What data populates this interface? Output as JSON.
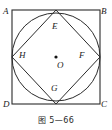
{
  "figure": {
    "caption": "图 5—66",
    "stroke_color": "#2b2b2b",
    "fill_color": "none",
    "center_dot_color": "#141414",
    "background_color": "#ffffff"
  },
  "geometry": {
    "outer_square": {
      "name": "square ABCD",
      "left": 12,
      "top": 10,
      "right": 100,
      "bottom": 104,
      "width": 88,
      "height": 94
    },
    "inscribed_circle": {
      "name": "circle O",
      "cx": 56,
      "cy": 57,
      "r": 44
    },
    "inner_square": {
      "name": "square EFGH",
      "points": "56,10 100,57 56,104 12,57"
    },
    "center_point": {
      "label": "O",
      "cx": 56,
      "cy": 57,
      "dot_radius": 1.6
    }
  },
  "labels": {
    "A": {
      "text": "A",
      "x": 3,
      "y": 7
    },
    "B": {
      "text": "B",
      "x": 101,
      "y": 7
    },
    "C": {
      "text": "C",
      "x": 101,
      "y": 100
    },
    "D": {
      "text": "D",
      "x": 3,
      "y": 100
    },
    "E": {
      "text": "E",
      "x": 52,
      "y": 22
    },
    "F": {
      "text": "F",
      "x": 79,
      "y": 51
    },
    "G": {
      "text": "G",
      "x": 51,
      "y": 84
    },
    "H": {
      "text": "H",
      "x": 19,
      "y": 51
    },
    "O": {
      "text": "O",
      "x": 57,
      "y": 61
    }
  }
}
